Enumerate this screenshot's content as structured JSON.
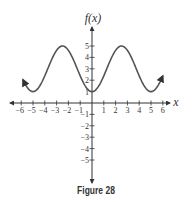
{
  "chart_data": {
    "type": "line",
    "title": "",
    "caption": "Figure 28",
    "xlabel": "x",
    "ylabel": "f(x)",
    "xlim": [
      -6.5,
      6.5
    ],
    "ylim": [
      -6.5,
      6.5
    ],
    "x_ticks": [
      -6,
      -5,
      -4,
      -3,
      -2,
      -1,
      1,
      2,
      3,
      4,
      5,
      6
    ],
    "y_ticks": [
      -5,
      -4,
      -3,
      -2,
      -1,
      1,
      2,
      3,
      4,
      5
    ],
    "grid": false,
    "series": [
      {
        "name": "f(x)",
        "function": "-2cos(2πx/5)+3",
        "x": [
          -5.85,
          -5,
          -3.75,
          -2.5,
          -1.25,
          0,
          1.25,
          2.5,
          3.75,
          5,
          6.0
        ],
        "values": [
          1.87,
          1,
          3,
          5,
          3,
          1,
          3,
          5,
          3,
          1,
          2.24
        ],
        "arrows_at_ends": true,
        "color": "#555555"
      }
    ]
  },
  "labels": {
    "ylabel": "f(x)",
    "xlabel": "x",
    "caption": "Figure 28"
  }
}
